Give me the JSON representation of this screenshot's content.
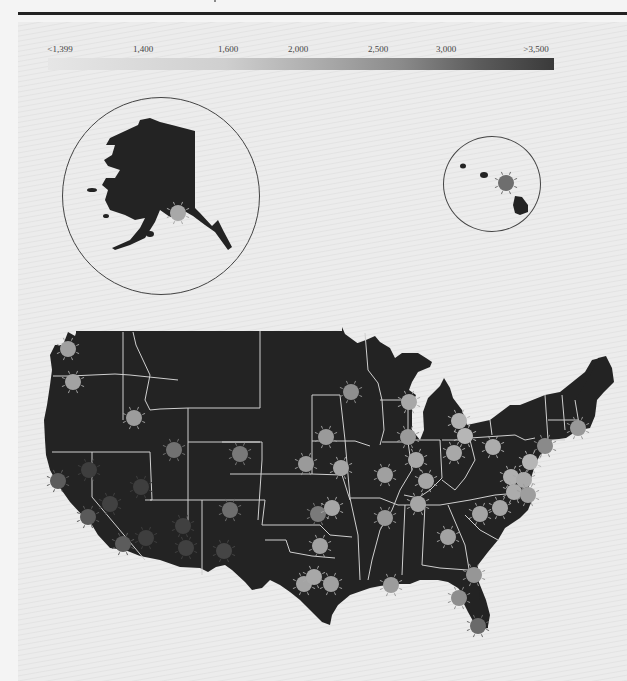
{
  "legend": {
    "labels": [
      "<1,399",
      "1,400",
      "1,600",
      "2,000",
      "2,500",
      "3,000",
      ">3,500"
    ],
    "gradient_from": "#e6e6e6",
    "gradient_to": "#3a3a3a"
  },
  "insets": {
    "alaska": {
      "label": "Alaska inset"
    },
    "hawaii": {
      "label": "Hawaii inset"
    }
  },
  "colors": {
    "land": "#232323",
    "state_border": "#cfcfcf",
    "background": "#ececec"
  },
  "cities": [
    {
      "x": 178,
      "y": 213,
      "shade": "#a8a8a8"
    },
    {
      "x": 506,
      "y": 183,
      "shade": "#6e6e6e"
    },
    {
      "x": 68,
      "y": 349,
      "shade": "#a0a0a0"
    },
    {
      "x": 73,
      "y": 382,
      "shade": "#a2a2a2"
    },
    {
      "x": 134,
      "y": 418,
      "shade": "#9c9c9c"
    },
    {
      "x": 174,
      "y": 450,
      "shade": "#717171"
    },
    {
      "x": 240,
      "y": 454,
      "shade": "#787878"
    },
    {
      "x": 58,
      "y": 481,
      "shade": "#5c5c5c"
    },
    {
      "x": 89,
      "y": 470,
      "shade": "#3e3e3e"
    },
    {
      "x": 141,
      "y": 487,
      "shade": "#3e3e3e"
    },
    {
      "x": 110,
      "y": 504,
      "shade": "#414141"
    },
    {
      "x": 88,
      "y": 517,
      "shade": "#5a5a5a"
    },
    {
      "x": 183,
      "y": 526,
      "shade": "#404040"
    },
    {
      "x": 146,
      "y": 538,
      "shade": "#3e3e3e"
    },
    {
      "x": 123,
      "y": 544,
      "shade": "#5c5c5c"
    },
    {
      "x": 186,
      "y": 548,
      "shade": "#404040"
    },
    {
      "x": 230,
      "y": 510,
      "shade": "#6e6e6e"
    },
    {
      "x": 224,
      "y": 551,
      "shade": "#454545"
    },
    {
      "x": 351,
      "y": 392,
      "shade": "#8e8e8e"
    },
    {
      "x": 409,
      "y": 402,
      "shade": "#a8a8a8"
    },
    {
      "x": 326,
      "y": 437,
      "shade": "#9a9a9a"
    },
    {
      "x": 408,
      "y": 437,
      "shade": "#9a9a9a"
    },
    {
      "x": 459,
      "y": 421,
      "shade": "#b2b2b2"
    },
    {
      "x": 465,
      "y": 436,
      "shade": "#b6b6b6"
    },
    {
      "x": 416,
      "y": 460,
      "shade": "#a8a8a8"
    },
    {
      "x": 454,
      "y": 453,
      "shade": "#a8a8a8"
    },
    {
      "x": 493,
      "y": 447,
      "shade": "#acacac"
    },
    {
      "x": 545,
      "y": 446,
      "shade": "#8a8a8a"
    },
    {
      "x": 578,
      "y": 428,
      "shade": "#989898"
    },
    {
      "x": 306,
      "y": 464,
      "shade": "#9a9a9a"
    },
    {
      "x": 341,
      "y": 468,
      "shade": "#a6a6a6"
    },
    {
      "x": 385,
      "y": 475,
      "shade": "#a0a0a0"
    },
    {
      "x": 426,
      "y": 481,
      "shade": "#a6a6a6"
    },
    {
      "x": 530,
      "y": 462,
      "shade": "#b6b6b6"
    },
    {
      "x": 511,
      "y": 477,
      "shade": "#b0b0b0"
    },
    {
      "x": 524,
      "y": 480,
      "shade": "#aaaaaa"
    },
    {
      "x": 514,
      "y": 492,
      "shade": "#acacac"
    },
    {
      "x": 528,
      "y": 495,
      "shade": "#9e9e9e"
    },
    {
      "x": 318,
      "y": 514,
      "shade": "#7a7a7a"
    },
    {
      "x": 332,
      "y": 508,
      "shade": "#a6a6a6"
    },
    {
      "x": 418,
      "y": 504,
      "shade": "#a6a6a6"
    },
    {
      "x": 385,
      "y": 518,
      "shade": "#989898"
    },
    {
      "x": 480,
      "y": 514,
      "shade": "#a4a4a4"
    },
    {
      "x": 500,
      "y": 508,
      "shade": "#a6a6a6"
    },
    {
      "x": 448,
      "y": 537,
      "shade": "#a2a2a2"
    },
    {
      "x": 320,
      "y": 546,
      "shade": "#a2a2a2"
    },
    {
      "x": 304,
      "y": 584,
      "shade": "#a4a4a4"
    },
    {
      "x": 314,
      "y": 577,
      "shade": "#a8a8a8"
    },
    {
      "x": 331,
      "y": 584,
      "shade": "#a0a0a0"
    },
    {
      "x": 391,
      "y": 585,
      "shade": "#9c9c9c"
    },
    {
      "x": 474,
      "y": 575,
      "shade": "#969696"
    },
    {
      "x": 459,
      "y": 598,
      "shade": "#8e8e8e"
    },
    {
      "x": 478,
      "y": 626,
      "shade": "#6a6a6a"
    }
  ]
}
